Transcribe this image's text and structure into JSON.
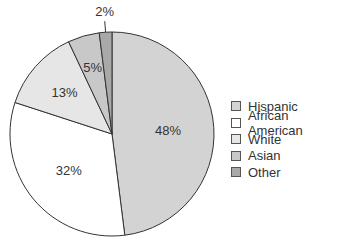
{
  "chart_data": {
    "type": "pie",
    "title": "",
    "categories": [
      "Hispanic",
      "African American",
      "White",
      "Asian",
      "Other"
    ],
    "values": [
      48,
      32,
      13,
      5,
      2
    ],
    "labels": [
      "48%",
      "32%",
      "13%",
      "5%",
      "2%"
    ],
    "colors": [
      "#d3d3d3",
      "#ffffff",
      "#e6e6e6",
      "#c8c8c8",
      "#a9a9a9"
    ],
    "legend_position": "right",
    "start_angle_deg": 0,
    "direction": "clockwise"
  },
  "legend": {
    "items": [
      {
        "label": "Hispanic",
        "color": "#d3d3d3"
      },
      {
        "label": "African American",
        "color": "#ffffff"
      },
      {
        "label": "White",
        "color": "#e6e6e6"
      },
      {
        "label": "Asian",
        "color": "#c8c8c8"
      },
      {
        "label": "Other",
        "color": "#a9a9a9"
      }
    ]
  }
}
